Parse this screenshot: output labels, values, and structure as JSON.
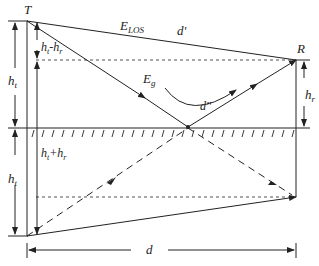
{
  "diagram": {
    "labels": {
      "transmitter": "T",
      "receiver": "R",
      "los_field": "E",
      "los_sub": "LOS",
      "ground_field": "E",
      "ground_sub": "g",
      "los_distance": "d'",
      "reflected_distance": "d''",
      "transmitter_height": "h",
      "transmitter_height_sub": "t",
      "receiver_height": "h",
      "receiver_height_sub": "r",
      "height_diff_a": "h",
      "height_diff_a_sub": "t",
      "height_diff_op": "-h",
      "height_diff_b_sub": "r",
      "height_sum_a": "h",
      "height_sum_a_sub": "t",
      "height_sum_op": "+h",
      "height_sum_b_sub": "r",
      "image_height": "h",
      "image_height_sub": "t",
      "horizontal_distance": "d"
    },
    "colors": {
      "line": "#222222",
      "background": "#ffffff"
    }
  }
}
